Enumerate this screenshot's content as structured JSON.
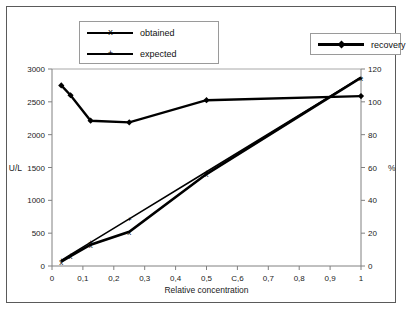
{
  "legend": {
    "left": [
      {
        "label": "obtained",
        "marker": "x",
        "icon": "line-marker-x-icon"
      },
      {
        "label": "expected",
        "marker": "+",
        "icon": "line-marker-plus-icon"
      }
    ],
    "right": [
      {
        "label": "recovery",
        "marker": "diamond",
        "icon": "line-marker-diamond-icon"
      }
    ]
  },
  "chart_data": {
    "type": "line",
    "title": "",
    "xlabel": "Relative concentration",
    "ylabel": "U/L",
    "y2label": "%",
    "xlim": [
      0,
      1
    ],
    "ylim": [
      0,
      3000
    ],
    "y2lim": [
      0,
      120
    ],
    "grid": false,
    "legend_position": "top",
    "xticks": [
      "0",
      "0,1",
      "0,2",
      "0,3",
      "0,4",
      "0,5",
      "C,6",
      "0,7",
      "0,8",
      "0,9",
      "1"
    ],
    "xtick_values": [
      0,
      0.1,
      0.2,
      0.3,
      0.4,
      0.5,
      0.6,
      0.7,
      0.8,
      0.9,
      1
    ],
    "yticks": [
      "0",
      "500",
      "1000",
      "1500",
      "2000",
      "2500",
      "3000"
    ],
    "ytick_values": [
      0,
      500,
      1000,
      1500,
      2000,
      2500,
      3000
    ],
    "y2ticks": [
      "0",
      "20",
      "40",
      "60",
      "80",
      "100",
      "120"
    ],
    "y2tick_values": [
      0,
      20,
      40,
      60,
      80,
      100,
      120
    ],
    "series": [
      {
        "name": "obtained",
        "axis": "left",
        "units": "U/L",
        "marker": "x",
        "x": [
          0.03,
          0.06,
          0.125,
          0.25,
          0.5,
          1.0
        ],
        "values": [
          65,
          150,
          325,
          520,
          1400,
          2870
        ]
      },
      {
        "name": "expected",
        "axis": "left",
        "units": "U/L",
        "marker": "+",
        "x": [
          0.03,
          0.06,
          0.125,
          0.25,
          0.5,
          1.0
        ],
        "values": [
          86,
          172,
          359,
          718,
          1435,
          2870
        ]
      },
      {
        "name": "recovery",
        "axis": "right",
        "units": "%",
        "marker": "diamond",
        "x": [
          0.03,
          0.06,
          0.125,
          0.25,
          0.5,
          1.0
        ],
        "values": [
          110,
          104,
          88.5,
          87.5,
          101,
          103.5
        ]
      }
    ]
  }
}
